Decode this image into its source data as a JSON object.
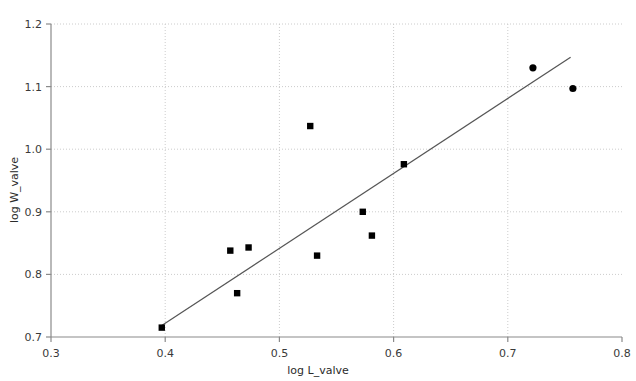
{
  "chart_data": {
    "type": "scatter",
    "title": "",
    "xlabel": "log L_valve",
    "ylabel": "log W_valve",
    "xlim": [
      0.3,
      0.8
    ],
    "ylim": [
      0.7,
      1.2
    ],
    "xticks": [
      "0.3",
      "0.4",
      "0.5",
      "0.6",
      "0.7",
      "0.8"
    ],
    "xtick_values": [
      0.3,
      0.4,
      0.5,
      0.6,
      0.7,
      0.8
    ],
    "yticks": [
      "0.7",
      "0.8",
      "0.9",
      "1.0",
      "1.1",
      "1.2"
    ],
    "ytick_values": [
      0.7,
      0.8,
      0.9,
      1.0,
      1.1,
      1.2
    ],
    "grid": true,
    "grid_style": "dotted",
    "grid_color": "#cccccc",
    "legend": "none",
    "marker_color": "#000000",
    "series": [
      {
        "name": "square-markers",
        "marker": "square",
        "points": [
          {
            "x": 0.397,
            "y": 0.715
          },
          {
            "x": 0.457,
            "y": 0.838
          },
          {
            "x": 0.463,
            "y": 0.77
          },
          {
            "x": 0.473,
            "y": 0.843
          },
          {
            "x": 0.527,
            "y": 1.037
          },
          {
            "x": 0.533,
            "y": 0.83
          },
          {
            "x": 0.573,
            "y": 0.9
          },
          {
            "x": 0.581,
            "y": 0.862
          },
          {
            "x": 0.609,
            "y": 0.976
          }
        ]
      },
      {
        "name": "circle-markers",
        "marker": "circle",
        "points": [
          {
            "x": 0.722,
            "y": 1.13
          },
          {
            "x": 0.757,
            "y": 1.097
          }
        ]
      }
    ],
    "trendline": {
      "name": "fit-line",
      "color": "#555555",
      "x_start": 0.396,
      "y_start": 0.717,
      "x_end": 0.755,
      "y_end": 1.147
    }
  }
}
